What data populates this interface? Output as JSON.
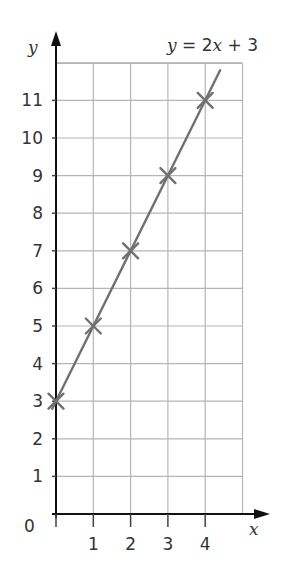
{
  "chart_data": {
    "type": "line",
    "title": "y = 2x + 3",
    "equation": {
      "prefix": "y",
      "middle": " = 2",
      "xvar": "x",
      "suffix": " + 3"
    },
    "xlabel": "x",
    "ylabel": "y",
    "origin_label": "0",
    "x_ticks": [
      1,
      2,
      3,
      4
    ],
    "y_ticks": [
      1,
      2,
      3,
      4,
      5,
      6,
      7,
      8,
      9,
      10,
      11
    ],
    "xlim": [
      0,
      5
    ],
    "ylim": [
      0,
      12
    ],
    "grid": true,
    "series": [
      {
        "name": "y = 2x + 3",
        "x": [
          0,
          1,
          2,
          3,
          4
        ],
        "values": [
          3,
          5,
          7,
          9,
          11
        ],
        "marker": "x",
        "line_extends": [
          -0.1,
          4.4
        ]
      }
    ],
    "colors": {
      "line": "#707070",
      "grid": "#b5b5b5",
      "axis": "#111111",
      "text": "#333333"
    }
  }
}
